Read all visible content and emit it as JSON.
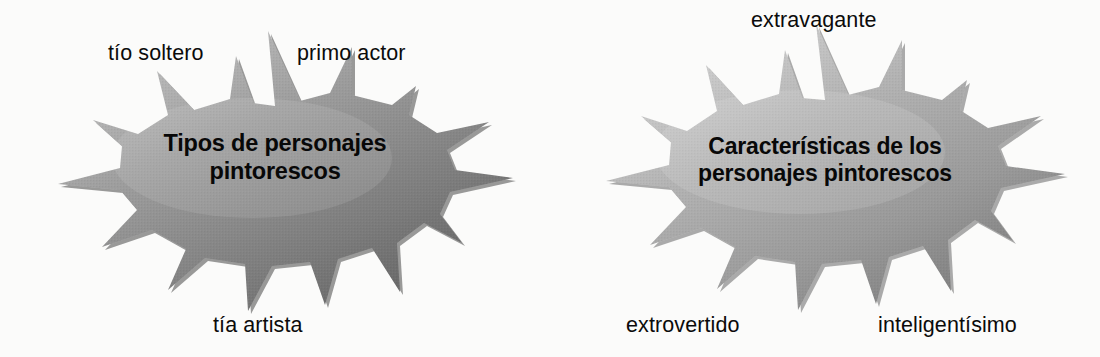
{
  "page": {
    "background_color": "#fbfbfa",
    "text_color": "#0b0b0b"
  },
  "diagrams": [
    {
      "id": "left",
      "shape": "starburst-explosion",
      "fill_light": "#b5b5b5",
      "fill_mid": "#8e8e8e",
      "fill_dark": "#6a6a6a",
      "title": "Tipos de personajes\npintorescos",
      "callouts": [
        {
          "id": "tio-soltero",
          "label": "tío soltero"
        },
        {
          "id": "primo-actor",
          "label": "primo actor"
        },
        {
          "id": "tia-artista",
          "label": "tía artista"
        }
      ]
    },
    {
      "id": "right",
      "shape": "starburst-explosion",
      "fill_light": "#c6c6c6",
      "fill_mid": "#a2a2a2",
      "fill_dark": "#7d7d7d",
      "title": "Características de los\npersonajes pintorescos",
      "callouts": [
        {
          "id": "extravagante",
          "label": "extravagante"
        },
        {
          "id": "extrovertido",
          "label": "extrovertido"
        },
        {
          "id": "inteligentisimo",
          "label": "inteligentísimo"
        }
      ]
    }
  ]
}
